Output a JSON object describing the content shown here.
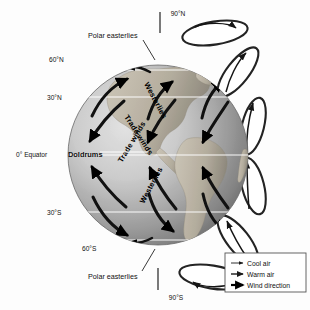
{
  "diagram": {
    "background_color": "#fdfdfd"
  },
  "latitude_labels": [
    {
      "id": "lat-90n",
      "text": "90°N"
    },
    {
      "id": "lat-60n",
      "text": "60°N"
    },
    {
      "id": "lat-30n",
      "text": "30°N"
    },
    {
      "id": "lat-0",
      "text": "0° Equator"
    },
    {
      "id": "lat-30s",
      "text": "30°S"
    },
    {
      "id": "lat-60s",
      "text": "60°S"
    },
    {
      "id": "lat-90s",
      "text": "90°S"
    }
  ],
  "callouts": {
    "polar_easterlies_north": "Polar easterlies",
    "polar_easterlies_south": "Polar easterlies",
    "doldrums": "Doldrums"
  },
  "wind_belts": [
    {
      "id": "westerlies-north",
      "text": "Westerlies"
    },
    {
      "id": "trade-winds-north",
      "text": "Trade winds"
    },
    {
      "id": "trade-winds-south",
      "text": "Trade winds"
    },
    {
      "id": "westerlies-south",
      "text": "Westerlies"
    }
  ],
  "legend": {
    "items": [
      {
        "id": "cool-air",
        "label": "Cool air",
        "arrow": "thin-arrow",
        "color": "#1a1a1a"
      },
      {
        "id": "warm-air",
        "label": "Warm air",
        "arrow": "medium-arrow",
        "color": "#1a1a1a"
      },
      {
        "id": "wind-direction",
        "label": "Wind direction",
        "arrow": "thick-arrow",
        "color": "#000000"
      }
    ],
    "border_color": "#555555"
  },
  "colors": {
    "ocean_light": "#cfcfcf",
    "ocean_dark": "#7d7d7d",
    "land": "#b9b2a6",
    "latitude_line": "#ffffff",
    "arrow": "#111111",
    "cell_fill": "#ffffff",
    "cell_stroke": "#222222"
  }
}
